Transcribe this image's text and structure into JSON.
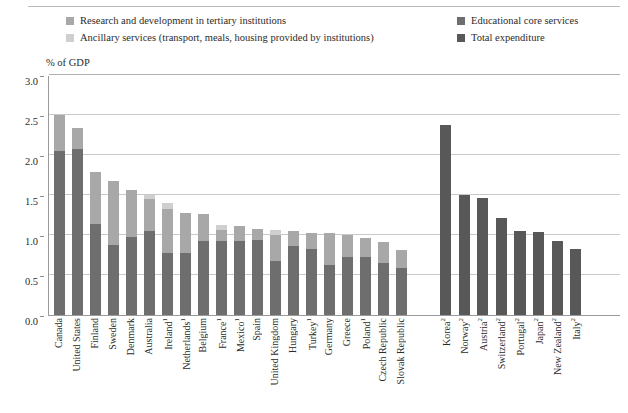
{
  "axis_title": "% of GDP",
  "legend": {
    "left": [
      {
        "label": "Research and development in tertiary institutions",
        "color": "#a8a8a8",
        "key": "rnd"
      },
      {
        "label": "Ancillary services (transport, meals, housing provided by institutions)",
        "color": "#cfcfcf",
        "key": "ancillary"
      }
    ],
    "right": [
      {
        "label": "Educational core services",
        "color": "#6e6e6e",
        "key": "core"
      },
      {
        "label": "Total expenditure",
        "color": "#585858",
        "key": "total"
      }
    ]
  },
  "colors": {
    "core": "#6e6e6e",
    "rnd": "#a8a8a8",
    "ancillary": "#cfcfcf",
    "total": "#585858",
    "grid": "#c9c9c9",
    "axis": "#9a9a9a"
  },
  "chart_data": {
    "type": "bar",
    "stacked": true,
    "title": "",
    "xlabel": "",
    "ylabel": "% of GDP",
    "ylim": [
      0.0,
      3.0
    ],
    "yticks": [
      "0.0",
      "0.5",
      "1.0",
      "1.5",
      "2.0",
      "2.5",
      "3.0"
    ],
    "ytick_values": [
      0.0,
      0.5,
      1.0,
      1.5,
      2.0,
      2.5,
      3.0
    ],
    "grid": true,
    "legend_position": "top",
    "series": [
      {
        "name": "Educational core services",
        "key": "core",
        "color": "#6e6e6e"
      },
      {
        "name": "Research and development in tertiary institutions",
        "key": "rnd",
        "color": "#a8a8a8"
      },
      {
        "name": "Ancillary services (transport, meals, housing provided by institutions)",
        "key": "ancillary",
        "color": "#cfcfcf"
      },
      {
        "name": "Total expenditure",
        "key": "total",
        "color": "#585858"
      }
    ],
    "groups": [
      {
        "name": "breakdown-available",
        "bars": [
          {
            "category": "Canada",
            "note": "",
            "core": 2.05,
            "rnd": 0.45,
            "ancillary": 0.0,
            "total": 2.5
          },
          {
            "category": "United States",
            "note": "",
            "core": 2.08,
            "rnd": 0.26,
            "ancillary": 0.0,
            "total": 2.34
          },
          {
            "category": "Finland",
            "note": "",
            "core": 1.14,
            "rnd": 0.65,
            "ancillary": 0.0,
            "total": 1.79
          },
          {
            "category": "Sweden",
            "note": "",
            "core": 0.88,
            "rnd": 0.8,
            "ancillary": 0.0,
            "total": 1.68
          },
          {
            "category": "Denmark",
            "note": "",
            "core": 0.98,
            "rnd": 0.58,
            "ancillary": 0.0,
            "total": 1.56
          },
          {
            "category": "Australia",
            "note": "",
            "core": 1.05,
            "rnd": 0.4,
            "ancillary": 0.05,
            "total": 1.5
          },
          {
            "category": "Ireland",
            "note": "1",
            "core": 0.77,
            "rnd": 0.56,
            "ancillary": 0.07,
            "total": 1.4
          },
          {
            "category": "Netherlands",
            "note": "1",
            "core": 0.77,
            "rnd": 0.51,
            "ancillary": 0.0,
            "total": 1.28
          },
          {
            "category": "Belgium",
            "note": "",
            "core": 0.93,
            "rnd": 0.33,
            "ancillary": 0.0,
            "total": 1.26
          },
          {
            "category": "France",
            "note": "1",
            "core": 0.92,
            "rnd": 0.14,
            "ancillary": 0.07,
            "total": 1.13
          },
          {
            "category": "Mexico",
            "note": "1",
            "core": 0.92,
            "rnd": 0.19,
            "ancillary": 0.0,
            "total": 1.11
          },
          {
            "category": "Spain",
            "note": "",
            "core": 0.94,
            "rnd": 0.14,
            "ancillary": 0.0,
            "total": 1.08
          },
          {
            "category": "United Kingdom",
            "note": "",
            "core": 0.68,
            "rnd": 0.32,
            "ancillary": 0.06,
            "total": 1.06
          },
          {
            "category": "Hungary",
            "note": "",
            "core": 0.86,
            "rnd": 0.19,
            "ancillary": 0.0,
            "total": 1.05
          },
          {
            "category": "Turkey",
            "note": "1",
            "core": 0.83,
            "rnd": 0.19,
            "ancillary": 0.0,
            "total": 1.02
          },
          {
            "category": "Germany",
            "note": "",
            "core": 0.62,
            "rnd": 0.41,
            "ancillary": 0.0,
            "total": 1.03
          },
          {
            "category": "Greece",
            "note": "",
            "core": 0.73,
            "rnd": 0.27,
            "ancillary": 0.0,
            "total": 1.0
          },
          {
            "category": "Poland",
            "note": "1",
            "core": 0.73,
            "rnd": 0.23,
            "ancillary": 0.0,
            "total": 0.96
          },
          {
            "category": "Czech Republic",
            "note": "",
            "core": 0.65,
            "rnd": 0.26,
            "ancillary": 0.0,
            "total": 0.91
          },
          {
            "category": "Slovak Republic",
            "note": "",
            "core": 0.59,
            "rnd": 0.22,
            "ancillary": 0.0,
            "total": 0.81
          }
        ]
      },
      {
        "name": "total-only",
        "bars": [
          {
            "category": "Korea",
            "note": "2",
            "total": 2.37
          },
          {
            "category": "Norway",
            "note": "2",
            "total": 1.5
          },
          {
            "category": "Austria",
            "note": "2",
            "total": 1.46
          },
          {
            "category": "Switzerland",
            "note": "2",
            "total": 1.21
          },
          {
            "category": "Portugal",
            "note": "2",
            "total": 1.05
          },
          {
            "category": "Japan",
            "note": "2",
            "total": 1.04
          },
          {
            "category": "New Zealand",
            "note": "2",
            "total": 0.93
          },
          {
            "category": "Italy",
            "note": "2",
            "total": 0.82
          }
        ]
      }
    ]
  }
}
